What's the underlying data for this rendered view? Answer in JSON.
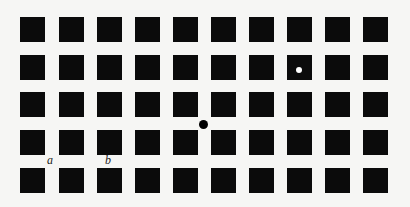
{
  "figure": {
    "grid": {
      "rows": 5,
      "cols": 10,
      "square_size": 25,
      "col_lefts": [
        20,
        59,
        97,
        135,
        173,
        211,
        249,
        287,
        325,
        363
      ],
      "row_tops": [
        17,
        55,
        92,
        130,
        168
      ],
      "square_color": "#0b0b0b",
      "background": "#f6f6f4"
    },
    "dots": [
      {
        "name": "black-dot",
        "kind": "black",
        "cx": 203,
        "cy": 124
      },
      {
        "name": "white-dot",
        "kind": "white",
        "cx": 299,
        "cy": 70
      }
    ],
    "labels": [
      {
        "name": "label-a",
        "text": "a",
        "x": 47,
        "y": 154
      },
      {
        "name": "label-b",
        "text": "b",
        "x": 105,
        "y": 154
      }
    ]
  }
}
